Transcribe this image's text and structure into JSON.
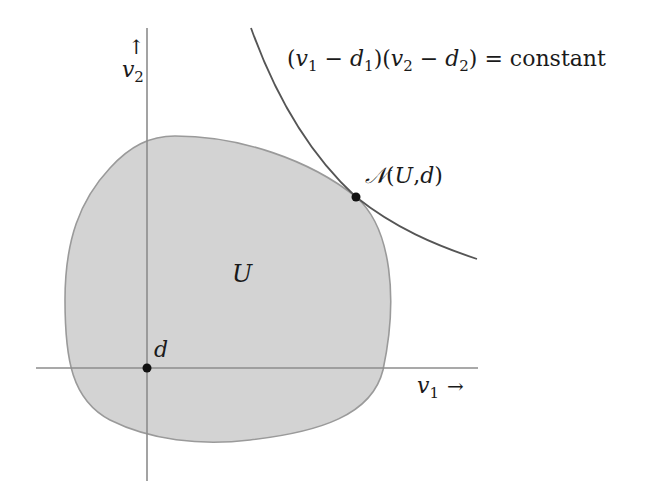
{
  "figure": {
    "colors": {
      "background": "#ffffff",
      "region_fill": "#d3d3d3",
      "region_stroke": "#9a9a9a",
      "axis": "#8c8c8c",
      "curve": "#555555",
      "point": "#111111",
      "text": "#1a1a1a"
    }
  },
  "axes": {
    "x_label_var": "v",
    "x_label_sub": "1",
    "x_arrow": "→",
    "y_label_var": "v",
    "y_label_sub": "2",
    "y_arrow": "↑"
  },
  "region": {
    "label": "U"
  },
  "points": {
    "disagreement": {
      "label": "d"
    },
    "nash": {
      "label_N": "𝒩",
      "label_open": "(",
      "label_U": "U",
      "label_comma": ",",
      "label_d": "d",
      "label_close": ")"
    }
  },
  "curve": {
    "formula_open1": "(",
    "formula_v1": "v",
    "formula_v1_sub": "1",
    "formula_minus1": " − ",
    "formula_d1": "d",
    "formula_d1_sub": "1",
    "formula_close1": ")(",
    "formula_v2": "v",
    "formula_v2_sub": "2",
    "formula_minus2": " − ",
    "formula_d2": "d",
    "formula_d2_sub": "2",
    "formula_close2": ")",
    "formula_eq": " = constant"
  }
}
